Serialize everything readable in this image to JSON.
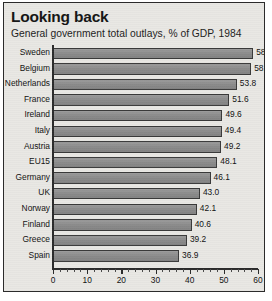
{
  "card": {
    "title": "Looking back",
    "subtitle": "General government total outlays, % of GDP, 1984"
  },
  "chart_data": {
    "type": "bar",
    "orientation": "horizontal",
    "title": "Looking back",
    "subtitle": "General government total outlays, % of GDP, 1984",
    "xlabel": "",
    "ylabel": "",
    "xlim": [
      0,
      60
    ],
    "grid": false,
    "legend": null,
    "bar_color": "#8e8e8e",
    "tick_labels": [
      "0",
      "10",
      "20",
      "30",
      "40",
      "50",
      "60"
    ],
    "tick_values": [
      0,
      10,
      20,
      30,
      40,
      50,
      60
    ],
    "minor_tick_step": 2,
    "categories": [
      "Sweden",
      "Belgium",
      "Netherlands",
      "France",
      "Ireland",
      "Italy",
      "Austria",
      "EU15",
      "Germany",
      "UK",
      "Norway",
      "Finland",
      "Greece",
      "Spain"
    ],
    "values": [
      58.6,
      58.0,
      53.8,
      51.6,
      49.6,
      49.4,
      49.2,
      48.1,
      46.1,
      43.0,
      42.1,
      40.6,
      39.2,
      36.9
    ],
    "value_labels": [
      "58.6",
      "58.0",
      "53.8",
      "51.6",
      "49.6",
      "49.4",
      "49.2",
      "48.1",
      "46.1",
      "43.0",
      "42.1",
      "40.6",
      "39.2",
      "36.9"
    ]
  }
}
